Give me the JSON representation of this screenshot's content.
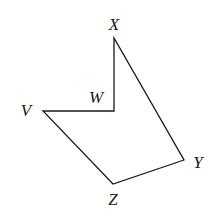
{
  "diagram": {
    "type": "polygon",
    "stroke_color": "#1a1a1a",
    "background": "#ffffff",
    "vertices": [
      {
        "name": "X",
        "x": 114,
        "y": 38,
        "label_x": 114,
        "label_y": 26
      },
      {
        "name": "W",
        "x": 114,
        "y": 111,
        "label_x": 96,
        "label_y": 99
      },
      {
        "name": "V",
        "x": 43,
        "y": 111,
        "label_x": 26,
        "label_y": 112
      },
      {
        "name": "Z",
        "x": 113,
        "y": 184,
        "label_x": 113,
        "label_y": 201
      },
      {
        "name": "Y",
        "x": 184,
        "y": 160,
        "label_x": 198,
        "label_y": 164
      }
    ],
    "edges": [
      [
        "X",
        "W"
      ],
      [
        "W",
        "V"
      ],
      [
        "V",
        "Z"
      ],
      [
        "Z",
        "Y"
      ],
      [
        "Y",
        "X"
      ]
    ],
    "labels": {
      "x": "X",
      "w": "W",
      "v": "V",
      "z": "Z",
      "y": "Y"
    }
  }
}
